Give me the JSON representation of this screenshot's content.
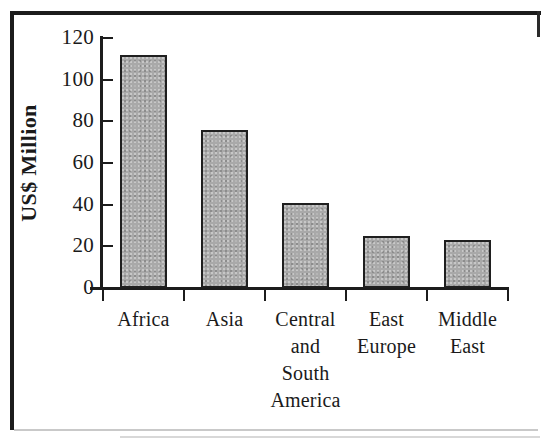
{
  "figure": {
    "background_color": "#ffffff",
    "border_color": "#1c1c1c",
    "bar_fill_color": "#a9a9a9",
    "bar_edge_color": "#1f1f1f"
  },
  "chart_data": {
    "type": "bar",
    "title": "",
    "xlabel": "",
    "ylabel": "US$ Million",
    "categories": [
      "Africa",
      "Central and South America",
      "Asia",
      "East Europe",
      "Middle East"
    ],
    "category_lines": [
      [
        "Africa"
      ],
      [
        "Asia"
      ],
      [
        "Central",
        "and",
        "South",
        "America"
      ],
      [
        "East",
        "Europe"
      ],
      [
        "Middle",
        "East"
      ]
    ],
    "category_order": [
      "Africa",
      "Asia",
      "Central and South America",
      "East Europe",
      "Middle East"
    ],
    "values": [
      112,
      76,
      41,
      25,
      23
    ],
    "ylim": [
      0,
      120
    ],
    "yticks": [
      0,
      20,
      40,
      60,
      80,
      100,
      120
    ],
    "ytick_labels": [
      "0",
      "20",
      "40",
      "60",
      "80",
      "100",
      "120"
    ],
    "grid": false,
    "legend": false,
    "legend_position": "none"
  }
}
